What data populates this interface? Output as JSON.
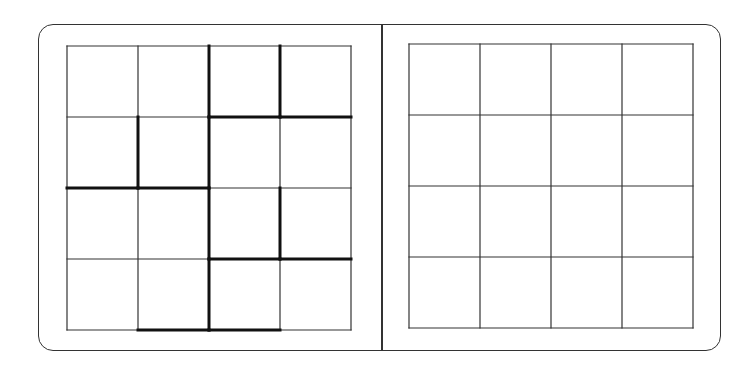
{
  "puzzle": {
    "title": "",
    "grid_size": 4,
    "colors": {
      "line": "#333333",
      "thick_line": "#111111",
      "background": "#ffffff"
    },
    "left_board": {
      "label": "puzzle-board",
      "cells": [
        [
          "",
          "",
          "",
          ""
        ],
        [
          "",
          "",
          "",
          ""
        ],
        [
          "",
          "",
          "",
          ""
        ],
        [
          "",
          "",
          "",
          ""
        ]
      ],
      "origin": [
        67,
        46
      ],
      "cell_size": 71,
      "thick_vertical": [
        {
          "col": 2,
          "row": 0
        },
        {
          "col": 2,
          "row": 1
        },
        {
          "col": 2,
          "row": 2
        },
        {
          "col": 2,
          "row": 3
        },
        {
          "col": 3,
          "row": 0
        },
        {
          "col": 3,
          "row": 2
        },
        {
          "col": 1,
          "row": 1
        }
      ],
      "thick_horizontal": [
        {
          "row": 1,
          "col": 2
        },
        {
          "row": 1,
          "col": 3
        },
        {
          "row": 2,
          "col": 0
        },
        {
          "row": 2,
          "col": 1
        },
        {
          "row": 3,
          "col": 2
        },
        {
          "row": 3,
          "col": 3
        },
        {
          "row": 4,
          "col": 1
        },
        {
          "row": 4,
          "col": 2
        }
      ]
    },
    "right_board": {
      "label": "answer-board",
      "cells": [
        [
          "",
          "",
          "",
          ""
        ],
        [
          "",
          "",
          "",
          ""
        ],
        [
          "",
          "",
          "",
          ""
        ],
        [
          "",
          "",
          "",
          ""
        ]
      ],
      "origin": [
        409,
        44
      ],
      "cell_size": 71
    }
  }
}
